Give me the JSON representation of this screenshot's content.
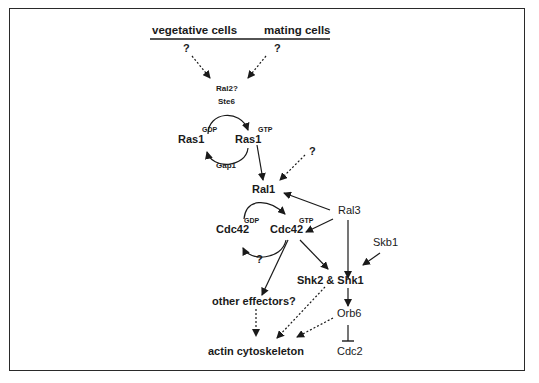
{
  "diagram": {
    "header": {
      "left": "vegetative cells",
      "right": "mating cells"
    },
    "unknowns": {
      "q_left": "?",
      "q_right": "?",
      "q_ral1": "?",
      "q_cdc42": "?"
    },
    "ras_cycle": {
      "gef_1": "Ral2?",
      "gef_2": "Ste6",
      "ras_gdp": "Ras1",
      "ras_gdp_sup": "GDP",
      "ras_gtp": "Ras1",
      "ras_gtp_sup": "GTP",
      "gap": "Gap1"
    },
    "cdc42_cycle": {
      "gef": "Ral1",
      "cdc42_gdp": "Cdc42",
      "cdc42_gdp_sup": "GDP",
      "cdc42_gtp": "Cdc42",
      "cdc42_gtp_sup": "GTP"
    },
    "nodes": {
      "ral3": "Ral3",
      "skb1": "Skb1",
      "shk": "Shk2 & Shk1",
      "other_effectors": "other effectors?",
      "orb6": "Orb6",
      "cdc2": "Cdc2",
      "actin": "actin cytoskeleton"
    }
  }
}
